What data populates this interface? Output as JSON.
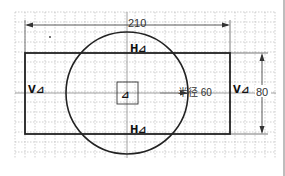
{
  "sketch": {
    "grid": {
      "x0": 15,
      "y0": 12,
      "x1": 276,
      "y1": 158,
      "spacing": 10,
      "color": "#a8a8a8"
    },
    "rectangle": {
      "x": 25,
      "y": 53,
      "width": 205,
      "height": 81,
      "stroke": "#222222"
    },
    "circle": {
      "cx": 127,
      "cy": 93,
      "r": 61,
      "stroke": "#222222"
    },
    "center_square": {
      "x": 117,
      "y": 82,
      "width": 21,
      "height": 22
    },
    "dimensions": {
      "width_label": "210",
      "height_label": "80",
      "radius_label": "半径 60"
    },
    "constraints": {
      "top": "H",
      "bottom": "H",
      "left": "V",
      "right": "V",
      "center_symbol": "⟂"
    }
  }
}
